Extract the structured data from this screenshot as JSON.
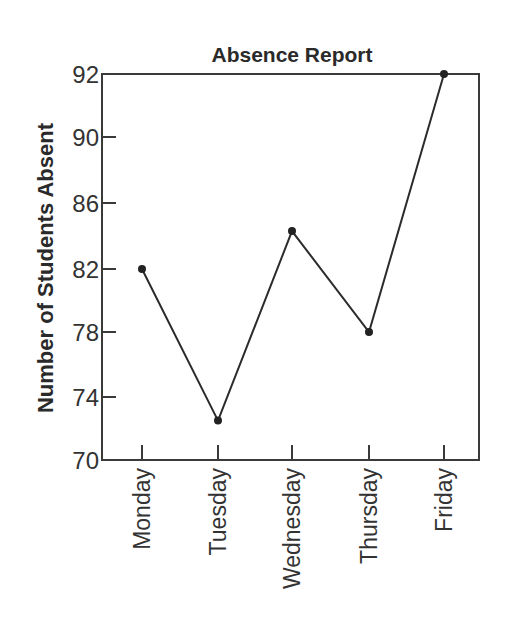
{
  "chart_data": {
    "type": "line",
    "title": "Absence Report",
    "xlabel": "",
    "ylabel": "Number of Students Absent",
    "categories": [
      "Monday",
      "Tuesday",
      "Wednesday",
      "Thursday",
      "Friday"
    ],
    "values": [
      82,
      72.5,
      84.3,
      78,
      92
    ],
    "series": [
      {
        "name": "Absences",
        "values": [
          82,
          72.5,
          84.3,
          78,
          92
        ]
      }
    ],
    "yticks": [
      70,
      74,
      78,
      82,
      86,
      90,
      92
    ],
    "ylim": [
      70,
      92
    ],
    "grid": false,
    "legend": null,
    "markers": true,
    "colors": {
      "line": "#2b2b2b",
      "axis": "#3a3a3a",
      "text": "#2a2a2a"
    }
  }
}
